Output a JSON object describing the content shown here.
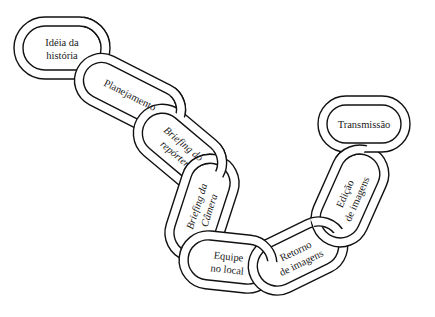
{
  "diagram": {
    "type": "chain",
    "title": "",
    "colors": {
      "stroke": "#111111",
      "fill": "#ffffff",
      "text": "#1a1a1a"
    },
    "links": [
      {
        "id": 1,
        "line1": "Idéia da",
        "line2": "história",
        "italic": false,
        "cx": 62,
        "cy": 48,
        "len": 96,
        "thick": 62,
        "angle": 0
      },
      {
        "id": 2,
        "line1": "Planejamento",
        "line2": "",
        "italic": false,
        "cx": 130,
        "cy": 95,
        "len": 118,
        "thick": 54,
        "angle": 27
      },
      {
        "id": 3,
        "line1": "Briefing do",
        "line2": "repórter",
        "italic": true,
        "cx": 180,
        "cy": 148,
        "len": 104,
        "thick": 58,
        "angle": 40
      },
      {
        "id": 4,
        "line1": "Briefing da",
        "line2": "Câmera",
        "italic": true,
        "cx": 202,
        "cy": 208,
        "len": 110,
        "thick": 58,
        "angle": -72
      },
      {
        "id": 5,
        "line1": "Equipe",
        "line2": "no local",
        "italic": false,
        "cx": 228,
        "cy": 262,
        "len": 98,
        "thick": 58,
        "angle": 6
      },
      {
        "id": 6,
        "line1": "Retorno",
        "line2": "de imagens",
        "italic": false,
        "cx": 298,
        "cy": 256,
        "len": 104,
        "thick": 58,
        "angle": -26
      },
      {
        "id": 7,
        "line1": "Edição",
        "line2": "de imagens",
        "italic": false,
        "cx": 350,
        "cy": 196,
        "len": 106,
        "thick": 58,
        "angle": -66
      },
      {
        "id": 8,
        "line1": "Transmissão",
        "line2": "",
        "italic": false,
        "cx": 364,
        "cy": 124,
        "len": 92,
        "thick": 56,
        "angle": 0
      }
    ]
  }
}
